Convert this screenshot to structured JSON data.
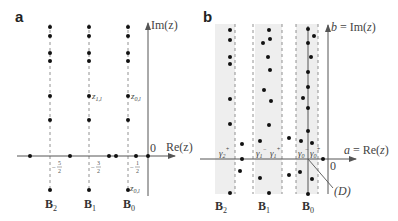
{
  "panels": {
    "a": {
      "label": "a",
      "y_axis_label": "Im(z)",
      "x_axis_label": "Re(z)",
      "origin_label": "0",
      "tick_labels": [
        "−5/2",
        "−3/2",
        "−1/2"
      ],
      "point_labels": {
        "z1": "z1,l",
        "z0": "z0,l",
        "z0_neg": "z0,l"
      },
      "strip_labels": [
        "B2",
        "B1",
        "B0"
      ]
    },
    "b": {
      "label": "b",
      "y_axis_label": "b = Im(z)",
      "x_axis_label": "a = Re(z)",
      "origin_label": "0",
      "gamma_labels": [
        "γ2+",
        "γ1−",
        "γ1+",
        "γ0−",
        "γ0+"
      ],
      "line_label": "(D)",
      "strip_labels": [
        "B2",
        "B1",
        "B0"
      ]
    }
  },
  "colors": {
    "axis": "#555555",
    "dot": "#111111",
    "dash": "#777777",
    "strip": "#eeeeee",
    "label": "#333333"
  }
}
